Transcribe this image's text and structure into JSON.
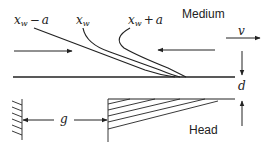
{
  "diagram": {
    "type": "magnetic recording head-medium field lines schematic",
    "regions": {
      "medium_label": "Medium",
      "head_label": "Head"
    },
    "curves": [
      {
        "id": "xw_minus_a",
        "label_main": "x",
        "label_sub": "w",
        "label_op": "−",
        "label_tail": "a"
      },
      {
        "id": "xw",
        "label_main": "x",
        "label_sub": "w"
      },
      {
        "id": "xw_plus_a",
        "label_main": "x",
        "label_sub": "w",
        "label_op": "+",
        "label_tail": "a"
      }
    ],
    "dimensions": {
      "velocity": "v",
      "spacing": "d",
      "gap": "g"
    },
    "colors": {
      "line": "#222222",
      "background": "#ffffff"
    }
  }
}
